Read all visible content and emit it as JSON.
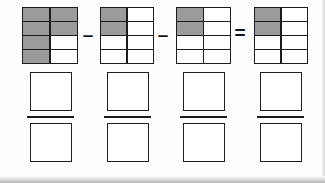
{
  "worksheet": {
    "title": "Fraction subtraction with shaded grid models",
    "grid": {
      "columns": 2,
      "rows": 4,
      "total_cells": 8
    },
    "colors": {
      "shaded_cell": "#9b9b9b",
      "empty_cell": "#ffffff",
      "grid_line": "#1c1c1c",
      "box_outline": "#1f1f1f",
      "page_background": "#ffffff"
    },
    "equation": {
      "terms": [
        {
          "index": 0,
          "name": "minuend",
          "shaded_count": 6,
          "total_count": 8,
          "fraction_text": "6/8",
          "cells": [
            {
              "row": 1,
              "col": 1,
              "shaded": true
            },
            {
              "row": 1,
              "col": 2,
              "shaded": true
            },
            {
              "row": 2,
              "col": 1,
              "shaded": true
            },
            {
              "row": 2,
              "col": 2,
              "shaded": true
            },
            {
              "row": 3,
              "col": 1,
              "shaded": true
            },
            {
              "row": 3,
              "col": 2,
              "shaded": false
            },
            {
              "row": 4,
              "col": 1,
              "shaded": true
            },
            {
              "row": 4,
              "col": 2,
              "shaded": false
            }
          ]
        },
        {
          "index": 1,
          "name": "subtrahend-1",
          "shaded_count": 2,
          "total_count": 8,
          "fraction_text": "2/8",
          "cells": [
            {
              "row": 1,
              "col": 1,
              "shaded": true
            },
            {
              "row": 1,
              "col": 2,
              "shaded": false
            },
            {
              "row": 2,
              "col": 1,
              "shaded": true
            },
            {
              "row": 2,
              "col": 2,
              "shaded": false
            },
            {
              "row": 3,
              "col": 1,
              "shaded": false
            },
            {
              "row": 3,
              "col": 2,
              "shaded": false
            },
            {
              "row": 4,
              "col": 1,
              "shaded": false
            },
            {
              "row": 4,
              "col": 2,
              "shaded": false
            }
          ]
        },
        {
          "index": 2,
          "name": "subtrahend-2",
          "shaded_count": 2,
          "total_count": 8,
          "fraction_text": "2/8",
          "cells": [
            {
              "row": 1,
              "col": 1,
              "shaded": true
            },
            {
              "row": 1,
              "col": 2,
              "shaded": false
            },
            {
              "row": 2,
              "col": 1,
              "shaded": true
            },
            {
              "row": 2,
              "col": 2,
              "shaded": false
            },
            {
              "row": 3,
              "col": 1,
              "shaded": false
            },
            {
              "row": 3,
              "col": 2,
              "shaded": false
            },
            {
              "row": 4,
              "col": 1,
              "shaded": false
            },
            {
              "row": 4,
              "col": 2,
              "shaded": false
            }
          ]
        },
        {
          "index": 3,
          "name": "result",
          "shaded_count": 2,
          "total_count": 8,
          "fraction_text": "2/8",
          "cells": [
            {
              "row": 1,
              "col": 1,
              "shaded": true
            },
            {
              "row": 1,
              "col": 2,
              "shaded": false
            },
            {
              "row": 2,
              "col": 1,
              "shaded": true
            },
            {
              "row": 2,
              "col": 2,
              "shaded": false
            },
            {
              "row": 3,
              "col": 1,
              "shaded": false
            },
            {
              "row": 3,
              "col": 2,
              "shaded": false
            },
            {
              "row": 4,
              "col": 1,
              "shaded": false
            },
            {
              "row": 4,
              "col": 2,
              "shaded": false
            }
          ]
        }
      ],
      "operators": [
        {
          "index": 0,
          "symbol": "–",
          "name": "minus"
        },
        {
          "index": 1,
          "symbol": "–",
          "name": "minus"
        },
        {
          "index": 2,
          "symbol": "=",
          "name": "equals"
        }
      ]
    },
    "answers": [
      {
        "index": 0,
        "numerator": "",
        "denominator": ""
      },
      {
        "index": 1,
        "numerator": "",
        "denominator": ""
      },
      {
        "index": 2,
        "numerator": "",
        "denominator": ""
      },
      {
        "index": 3,
        "numerator": "",
        "denominator": ""
      }
    ]
  }
}
